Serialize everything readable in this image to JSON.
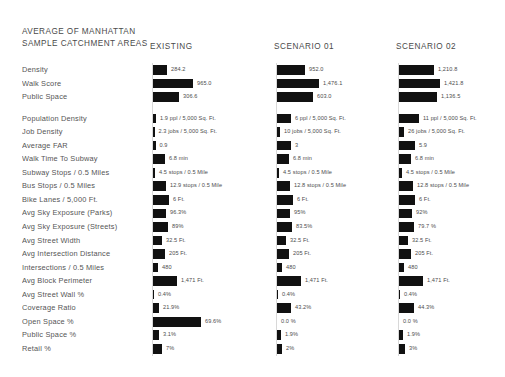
{
  "header": {
    "title": "AVERAGE OF MANHATTAN\nSAMPLE CATCHMENT AREAS",
    "columns": [
      {
        "key": "existing",
        "label": "EXISTING"
      },
      {
        "key": "scenario01",
        "label": "SCENARIO 01"
      },
      {
        "key": "scenario02",
        "label": "SCENARIO 02"
      }
    ]
  },
  "chart_data": {
    "type": "bar",
    "title": "AVERAGE OF MANHATTAN SAMPLE CATCHMENT AREAS",
    "orientation": "horizontal",
    "grid": false,
    "legend_position": "top",
    "series_names": [
      "EXISTING",
      "SCENARIO 01",
      "SCENARIO 02"
    ],
    "bar_color": "#111111",
    "groups": [
      {
        "name": "summary",
        "categories": [
          "Density",
          "Walk Score",
          "Public Space"
        ]
      },
      {
        "name": "metrics",
        "categories": [
          "Population Density",
          "Job Density",
          "Average FAR",
          "Walk Time To Subway",
          "Subway Stops / 0.5 Miles",
          "Bus Stops / 0.5 Miles",
          "Bike Lanes / 5,000 Ft.",
          "Avg Sky Exposure (Parks)",
          "Avg Sky Exposure (Streets)",
          "Avg Street Width",
          "Avg Intersection Distance",
          "Intersections / 0.5 Miles",
          "Avg Block Perimeter",
          "Avg Street Wall %",
          "Coverage Ratio",
          "Open Space %",
          "Public Space %",
          "Retail %"
        ]
      }
    ],
    "categories": [
      "Density",
      "Walk Score",
      "Public Space",
      "Population Density",
      "Job Density",
      "Average FAR",
      "Walk Time To Subway",
      "Subway Stops / 0.5 Miles",
      "Bus Stops / 0.5 Miles",
      "Bike Lanes / 5,000 Ft.",
      "Avg Sky Exposure (Parks)",
      "Avg Sky Exposure (Streets)",
      "Avg Street Width",
      "Avg Intersection Distance",
      "Intersections / 0.5 Miles",
      "Avg Block Perimeter",
      "Avg Street Wall %",
      "Coverage Ratio",
      "Open Space %",
      "Public Space %",
      "Retail %"
    ],
    "series": [
      {
        "name": "EXISTING",
        "labels": [
          "284.2",
          "965.0",
          "306.6",
          "1.9 ppl / 5,000 Sq. Ft.",
          "2.3 jobs / 5,000 Sq. Ft.",
          "0.9",
          "6.8 min",
          "4.5 stops / 0.5 Mile",
          "12.9 stops / 0.5 Mile",
          "6 Ft.",
          "96.3%",
          "89%",
          "32.5 Ft.",
          "205 Ft.",
          "480",
          "1,471 Ft.",
          "0.4%",
          "21.9%",
          "69.6%",
          "3.1%",
          "7%"
        ],
        "values": [
          284.2,
          965.0,
          306.6,
          1.9,
          2.3,
          0.9,
          6.8,
          4.5,
          12.9,
          6,
          96.3,
          89,
          32.5,
          205,
          480,
          1471,
          0.4,
          21.9,
          69.6,
          3.1,
          7
        ]
      },
      {
        "name": "SCENARIO 01",
        "labels": [
          "952.0",
          "1,476.1",
          "603.0",
          "6 ppl / 5,000 Sq. Ft.",
          "10 jobs / 5,000 Sq. Ft.",
          "3",
          "6.8 min",
          "4.5 stops / 0.5 Mile",
          "12.8 stops / 0.5 Mile",
          "6 Ft.",
          "95%",
          "83.5%",
          "32.5 Ft.",
          "205 Ft.",
          "480",
          "1,471 Ft.",
          "0.4%",
          "43.2%",
          "0.0 %",
          "1.9%",
          "2%"
        ],
        "values": [
          952.0,
          1476.1,
          603.0,
          6,
          10,
          3,
          6.8,
          4.5,
          12.8,
          6,
          95,
          83.5,
          32.5,
          205,
          480,
          1471,
          0.4,
          43.2,
          0.0,
          1.9,
          2
        ]
      },
      {
        "name": "SCENARIO 02",
        "labels": [
          "1,210.8",
          "1,421.8",
          "1,136.5",
          "11 ppl / 5,000 Sq. Ft.",
          "26 jobs / 5,000 Sq. Ft.",
          "5.9",
          "6.8 min",
          "4.5 stops / 0.5 Mile",
          "12.8 stops / 0.5 Mile",
          "6 Ft.",
          "92%",
          "79.7 %",
          "32.5 Ft.",
          "205 Ft.",
          "480",
          "1,471 Ft.",
          "0.4%",
          "44.3%",
          "0.0 %",
          "1.9%",
          "3%"
        ],
        "values": [
          1210.8,
          1421.8,
          1136.5,
          11,
          26,
          5.9,
          6.8,
          4.5,
          12.8,
          6,
          92,
          79.7,
          32.5,
          205,
          480,
          1471,
          0.4,
          44.3,
          0.0,
          1.9,
          3
        ]
      }
    ],
    "bar_widths": {
      "EXISTING": [
        14,
        40,
        26,
        3,
        1.5,
        2.5,
        12,
        2,
        13,
        16,
        13,
        15,
        9,
        12,
        5,
        24,
        1,
        6,
        48,
        6,
        9
      ],
      "SCENARIO 01": [
        28,
        42,
        36,
        14,
        3,
        14,
        12,
        2,
        13,
        16,
        13,
        15,
        9,
        12,
        5,
        24,
        1,
        14,
        0,
        4,
        5
      ],
      "SCENARIO 02": [
        35,
        41,
        38,
        20,
        5,
        16,
        12,
        3,
        14,
        16,
        13,
        15,
        9,
        12,
        5,
        24,
        1,
        15,
        0,
        4,
        6
      ]
    }
  },
  "layout": {
    "column_x": [
      153,
      277,
      399
    ],
    "column_header_x": [
      150,
      274,
      396
    ]
  }
}
